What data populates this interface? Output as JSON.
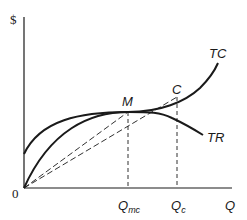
{
  "diagram": {
    "type": "economics-cost-revenue",
    "axes": {
      "y_label": "$",
      "x_label": "Q",
      "origin_label": "0",
      "color": "#1a1a1a"
    },
    "curves": {
      "total_cost": {
        "label": "TC",
        "color": "#1a1a1a"
      },
      "total_revenue": {
        "label": "TR",
        "color": "#1a1a1a"
      }
    },
    "points": {
      "m": {
        "label": "M"
      },
      "c": {
        "label": "C"
      }
    },
    "x_ticks": {
      "q_mc": {
        "main": "Q",
        "sub": "mc"
      },
      "q_c": {
        "main": "Q",
        "sub": "c"
      }
    },
    "line_style": {
      "rays": "dashed",
      "verticals": "dashed"
    }
  }
}
